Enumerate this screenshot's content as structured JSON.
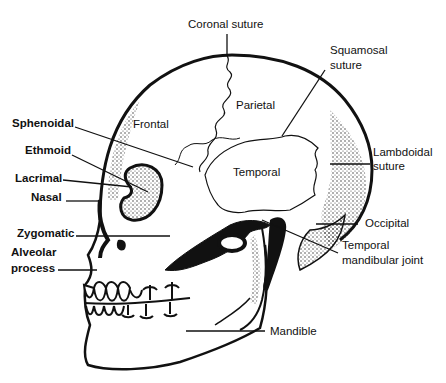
{
  "colors": {
    "ink": "#111111",
    "background": "#ffffff",
    "stipple": "#333333"
  },
  "labels": {
    "coronal_suture": "Coronal suture",
    "squamosal_suture_1": "Squamosal",
    "squamosal_suture_2": "suture",
    "parietal": "Parietal",
    "frontal": "Frontal",
    "sphenoidal": "Sphenoidal",
    "ethmoid": "Ethmoid",
    "lacrimal": "Lacrimal",
    "nasal": "Nasal",
    "temporal": "Temporal",
    "lambdoidal_suture_1": "Lambdoidal",
    "lambdoidal_suture_2": "suture",
    "zygomatic": "Zygomatic",
    "alveolar_process_1": "Alveolar",
    "alveolar_process_2": "process",
    "occipital": "Occipital",
    "tmj_1": "Temporal",
    "tmj_2": "mandibular joint",
    "mandible": "Mandible"
  }
}
